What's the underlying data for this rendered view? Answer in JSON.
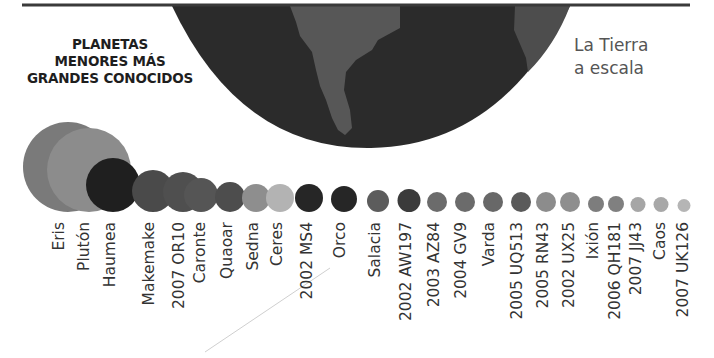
{
  "title": {
    "lines": [
      "PLANETAS",
      "MENORES MÁS",
      "GRANDES CONOCIDOS"
    ]
  },
  "earth": {
    "label_lines": [
      "La Tierra",
      "a escala"
    ],
    "ocean_color": "#2b2b2b",
    "land_color": "#555555"
  },
  "chart_data": {
    "type": "bubble",
    "title": "Planetas menores más grandes conocidos",
    "annotation": "La Tierra a escala",
    "baseline_y": 212,
    "categories": [
      "Eris",
      "Plutón",
      "Haumea",
      "Makemake",
      "2007 OR10",
      "Caronte",
      "Quaoar",
      "Sedna",
      "Ceres",
      "2002 MS4",
      "Orco",
      "Salacia",
      "2002 AW197",
      "2003 AZ84",
      "2004 GV9",
      "Varda",
      "2005 UQ513",
      "2005 RN43",
      "2002 UX25",
      "Ixión",
      "2006 QH181",
      "2007 JJ43",
      "Caos",
      "2007 UK126"
    ],
    "bodies": [
      {
        "name": "Eris",
        "cx": 68,
        "r": 45,
        "color": "#7a7a7a",
        "label_x": 60
      },
      {
        "name": "Plutón",
        "cx": 89,
        "r": 42,
        "color": "#8c8c8c",
        "label_x": 85
      },
      {
        "name": "Haumea",
        "cx": 113,
        "r": 27,
        "color": "#1f1f1f",
        "label_x": 111
      },
      {
        "name": "Makemake",
        "cx": 153,
        "r": 21,
        "color": "#4a4a4a",
        "label_x": 150
      },
      {
        "name": "2007 OR10",
        "cx": 183,
        "r": 20,
        "color": "#4f4f4f",
        "label_x": 180
      },
      {
        "name": "Caronte",
        "cx": 201,
        "r": 17,
        "color": "#555555",
        "label_x": 201
      },
      {
        "name": "Quaoar",
        "cx": 230,
        "r": 15,
        "color": "#4d4d4d",
        "label_x": 228
      },
      {
        "name": "Sedna",
        "cx": 256,
        "r": 14,
        "color": "#8e8e8e",
        "label_x": 254
      },
      {
        "name": "Ceres",
        "cx": 280,
        "r": 14,
        "color": "#b3b3b3",
        "label_x": 278
      },
      {
        "name": "2002 MS4",
        "cx": 309,
        "r": 14,
        "color": "#262626",
        "label_x": 308
      },
      {
        "name": "Orco",
        "cx": 344,
        "r": 13,
        "color": "#262626",
        "label_x": 341
      },
      {
        "name": "Salacia",
        "cx": 378,
        "r": 11,
        "color": "#5c5c5c",
        "label_x": 376
      },
      {
        "name": "2002 AW197",
        "cx": 409,
        "r": 11.5,
        "color": "#3b3b3b",
        "label_x": 407
      },
      {
        "name": "2003 AZ84",
        "cx": 437,
        "r": 10,
        "color": "#6b6b6b",
        "label_x": 435
      },
      {
        "name": "2004 GV9",
        "cx": 465,
        "r": 10,
        "color": "#6b6b6b",
        "label_x": 462
      },
      {
        "name": "Varda",
        "cx": 493,
        "r": 10,
        "color": "#686868",
        "label_x": 490
      },
      {
        "name": "2005 UQ513",
        "cx": 521,
        "r": 10,
        "color": "#5a5a5a",
        "label_x": 518
      },
      {
        "name": "2005 RN43",
        "cx": 546,
        "r": 10,
        "color": "#8c8c8c",
        "label_x": 544
      },
      {
        "name": "2002 UX25",
        "cx": 570,
        "r": 10,
        "color": "#8e8e8e",
        "label_x": 570
      },
      {
        "name": "Ixión",
        "cx": 596,
        "r": 8,
        "color": "#7d7d7d",
        "label_x": 594
      },
      {
        "name": "2006 QH181",
        "cx": 616,
        "r": 8,
        "color": "#808080",
        "label_x": 616
      },
      {
        "name": "2007 JJ43",
        "cx": 638,
        "r": 7.5,
        "color": "#a6a6a6",
        "label_x": 637
      },
      {
        "name": "Caos",
        "cx": 661,
        "r": 7.5,
        "color": "#a8a8a8",
        "label_x": 661
      },
      {
        "name": "2007 UK126",
        "cx": 684,
        "r": 6.5,
        "color": "#b5b5b5",
        "label_x": 684
      }
    ]
  }
}
